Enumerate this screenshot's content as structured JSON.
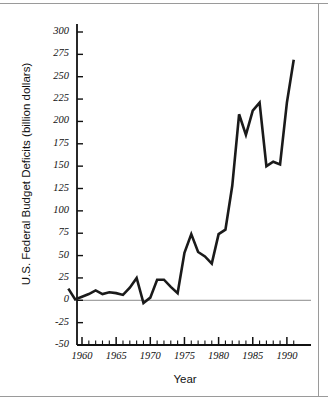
{
  "chart_data": {
    "type": "line",
    "title": "",
    "xlabel": "Year",
    "ylabel": "U.S. Federal Budget Deficits (billion dollars)",
    "xlim": [
      1958,
      1991
    ],
    "ylim": [
      -50,
      300
    ],
    "ytick_labels": [
      "300",
      "275",
      "250",
      "225",
      "200",
      "175",
      "150",
      "125",
      "100",
      "75",
      "50",
      "25",
      "0",
      "-25",
      "-50"
    ],
    "ytick_values": [
      300,
      275,
      250,
      225,
      200,
      175,
      150,
      125,
      100,
      75,
      50,
      25,
      0,
      -25,
      -50
    ],
    "xtick_labels": [
      "1960",
      "1965",
      "1970",
      "1975",
      "1980",
      "1985",
      "1990"
    ],
    "xtick_values": [
      1960,
      1965,
      1970,
      1975,
      1980,
      1985,
      1990
    ],
    "minor_xticks": true,
    "grid": false,
    "legend": "none",
    "zero_line": true,
    "line_color": "#1a1a1a",
    "line_width": 2.6,
    "x": [
      1958,
      1959,
      1960,
      1961,
      1962,
      1963,
      1964,
      1965,
      1966,
      1967,
      1968,
      1969,
      1970,
      1971,
      1972,
      1973,
      1974,
      1975,
      1976,
      1977,
      1978,
      1979,
      1980,
      1981,
      1982,
      1983,
      1984,
      1985,
      1986,
      1987,
      1988,
      1989,
      1990,
      1991
    ],
    "values": [
      13,
      1,
      4,
      7,
      11,
      7,
      9,
      8,
      6,
      14,
      25,
      -3,
      3,
      23,
      23,
      15,
      8,
      53,
      74,
      54,
      49,
      41,
      74,
      79,
      128,
      208,
      185,
      212,
      221,
      150,
      155,
      152,
      221,
      269
    ],
    "series": [
      {
        "name": "U.S. Federal Budget Deficit",
        "values": [
          13,
          1,
          4,
          7,
          11,
          7,
          9,
          8,
          6,
          14,
          25,
          -3,
          3,
          23,
          23,
          15,
          8,
          53,
          74,
          54,
          49,
          41,
          74,
          79,
          128,
          208,
          185,
          212,
          221,
          150,
          155,
          152,
          221,
          269
        ]
      }
    ]
  }
}
